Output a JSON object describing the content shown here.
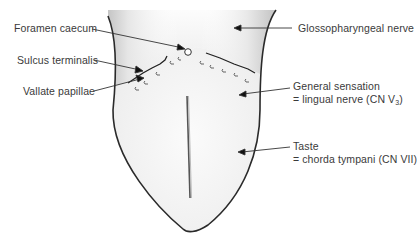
{
  "labels": {
    "foramen_caecum": "Foramen caecum",
    "sulcus_terminalis": "Sulcus terminalis",
    "vallate_papillae": "Vallate papillae",
    "glossopharyngeal": "Glossopharyngeal nerve",
    "general_sensation_line1": "General sensation",
    "general_sensation_line2_prefix": "= lingual nerve (CN V",
    "general_sensation_line2_sub": "3",
    "general_sensation_line2_suffix": ")",
    "taste_line1": "Taste",
    "taste_line2": "= chorda tympani (CN VII)"
  },
  "regions": [
    {
      "name": "posterior-third",
      "nerve": "Glossopharyngeal nerve"
    },
    {
      "name": "anterior-two-thirds-general",
      "nerve": "lingual nerve (CN V3)"
    },
    {
      "name": "anterior-two-thirds-taste",
      "nerve": "chorda tympani (CN VII)"
    }
  ],
  "colors": {
    "outline": "#2a2a2a",
    "text": "#3a3a3a",
    "posterior_shade": "#c8c8c8",
    "anterior_fill": "#f0f0f0"
  }
}
